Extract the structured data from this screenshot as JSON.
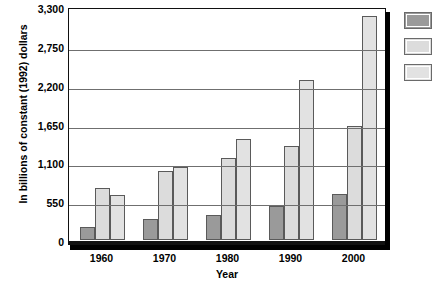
{
  "chart_data": {
    "type": "bar",
    "title": "",
    "xlabel": "Year",
    "ylabel": "In billions of constant (1992) dollars",
    "categories": [
      "1960",
      "1970",
      "1980",
      "1990",
      "2000"
    ],
    "ylim": [
      0,
      3300
    ],
    "yticks": [
      0,
      550,
      1100,
      1650,
      2200,
      2750,
      3300
    ],
    "ytick_labels": [
      "0",
      "550",
      "1,100",
      "1,650",
      "2,200",
      "2,750",
      "3,300"
    ],
    "grid": true,
    "legend_position": "right",
    "series": [
      {
        "name": "Series 1",
        "color": "#9a9a9a",
        "values": [
          180,
          300,
          350,
          480,
          650
        ]
      },
      {
        "name": "Series 2",
        "color": "#dcdcdc",
        "values": [
          740,
          980,
          1160,
          1330,
          1620
        ]
      },
      {
        "name": "Series 3",
        "color": "#e2e2e2",
        "values": [
          640,
          1040,
          1430,
          2270,
          3170
        ]
      }
    ]
  },
  "axis": {
    "y_title": "In billions of constant (1992) dollars",
    "x_title": "Year"
  },
  "legend": {
    "items": [
      {
        "label": "",
        "color": "#9a9a9a"
      },
      {
        "label": "",
        "color": "#dcdcdc"
      },
      {
        "label": "",
        "color": "#e2e2e2"
      }
    ]
  },
  "title_fragment": ""
}
